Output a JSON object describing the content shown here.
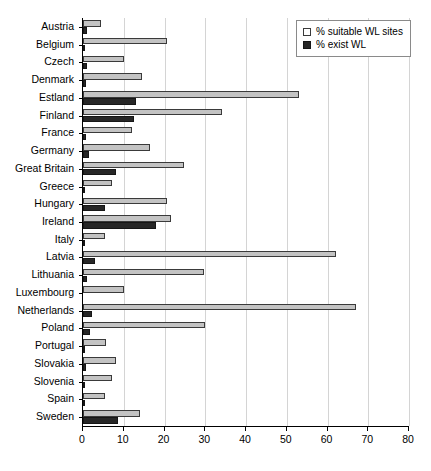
{
  "chart_data": {
    "type": "bar",
    "orientation": "horizontal",
    "title": "",
    "xlabel": "",
    "ylabel": "",
    "xlim": [
      0,
      80
    ],
    "xticks": [
      0,
      10,
      20,
      30,
      40,
      50,
      60,
      70,
      80
    ],
    "grid": true,
    "grid_axis": "x",
    "legend_position": "top-right",
    "categories": [
      "Austria",
      "Belgium",
      "Czech",
      "Denmark",
      "Estland",
      "Finland",
      "France",
      "Germany",
      "Great Britain",
      "Greece",
      "Hungary",
      "Ireland",
      "Italy",
      "Latvia",
      "Lithuania",
      "Luxembourg",
      "Netherlands",
      "Poland",
      "Portugal",
      "Slovakia",
      "Slovenia",
      "Spain",
      "Sweden"
    ],
    "series": [
      {
        "name": "% suitable WL sites",
        "color": "#c3c3c3",
        "values": [
          4.5,
          20.5,
          10,
          14.5,
          53,
          34,
          12,
          16.5,
          24.7,
          7,
          20.5,
          21.5,
          5.5,
          62,
          29.6,
          10,
          67,
          30,
          5.7,
          8,
          7,
          5.5,
          14
        ]
      },
      {
        "name": "% exist WL",
        "color": "#272727",
        "values": [
          1,
          0.5,
          1,
          0.8,
          13,
          12.5,
          0.8,
          1.5,
          8,
          0.5,
          5.5,
          18,
          0.5,
          3,
          1,
          0,
          2.2,
          1.7,
          0.6,
          0.8,
          0.4,
          0.6,
          8.6
        ]
      }
    ]
  },
  "legend": {
    "items": [
      {
        "label": "% suitable WL sites",
        "swatch": "light-square-icon"
      },
      {
        "label": "% exist WL",
        "swatch": "dark-square-icon"
      }
    ]
  }
}
